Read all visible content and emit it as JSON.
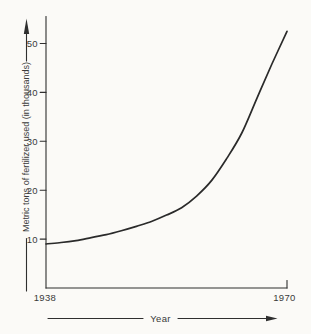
{
  "figure": {
    "paper_color": "#fbfaf7",
    "ink_color": "#2f2f2f",
    "text_color": "#3a3a3a"
  },
  "chart_data": {
    "type": "line",
    "title": "",
    "xlabel": "Year",
    "ylabel": "Metric tons of fertilizer used (in thousands)",
    "x": [
      1938,
      1940,
      1942,
      1944,
      1946,
      1948,
      1950,
      1952,
      1954,
      1956,
      1958,
      1960,
      1962,
      1964,
      1966,
      1968,
      1970
    ],
    "series": [
      {
        "name": "Metric tons of fertilizer used (in thousands)",
        "values": [
          9.0,
          9.3,
          9.7,
          10.3,
          10.9,
          11.7,
          12.6,
          13.6,
          14.9,
          16.4,
          18.8,
          22.0,
          26.5,
          31.7,
          38.8,
          45.8,
          52.5
        ]
      }
    ],
    "x_tick_labels": [
      "1938",
      "1970"
    ],
    "y_ticks": [
      10,
      20,
      30,
      40,
      50
    ],
    "xlim": [
      1938,
      1970
    ],
    "ylim": [
      0,
      55
    ],
    "grid": false,
    "legend": "none",
    "line_color": "#2a2a2a",
    "axis_arrows": [
      "y-axis-up-arrow",
      "x-axis-right-arrow"
    ]
  }
}
